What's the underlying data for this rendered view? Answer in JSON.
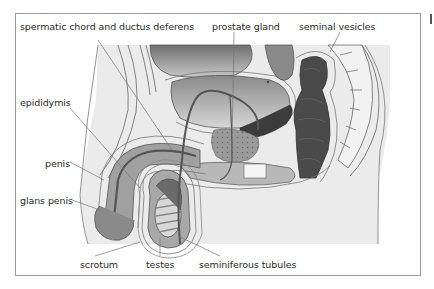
{
  "figure": {
    "labels": [
      {
        "id": "spermatic-chord",
        "text": "spermatic chord and ductus deferens",
        "x": 20,
        "y": 22
      },
      {
        "id": "prostate-gland",
        "text": "prostate gland",
        "x": 212,
        "y": 22
      },
      {
        "id": "seminal-vesicles",
        "text": "seminal vesicles",
        "x": 299,
        "y": 22
      },
      {
        "id": "epididymis",
        "text": "epididymis",
        "x": 20,
        "y": 98
      },
      {
        "id": "penis",
        "text": "penis",
        "x": 45,
        "y": 158
      },
      {
        "id": "glans-penis",
        "text": "glans penis",
        "x": 20,
        "y": 195
      },
      {
        "id": "scrotum",
        "text": "scrotum",
        "x": 80,
        "y": 258
      },
      {
        "id": "testes",
        "text": "testes",
        "x": 146,
        "y": 258
      },
      {
        "id": "seminiferous-tubules",
        "text": "seminiferous tubules",
        "x": 199,
        "y": 258
      }
    ],
    "colors": {
      "frame_border": "#9a9a9a",
      "background_body": "#ebebeb",
      "tissue_light": "#d4d4d4",
      "tissue_mid": "#a8a8a8",
      "tissue_dark": "#6a6a6a",
      "rectum_dark": "#3a3a3a",
      "outline": "#555555",
      "leader_line": "#777777",
      "text": "#2b2b2b"
    }
  }
}
